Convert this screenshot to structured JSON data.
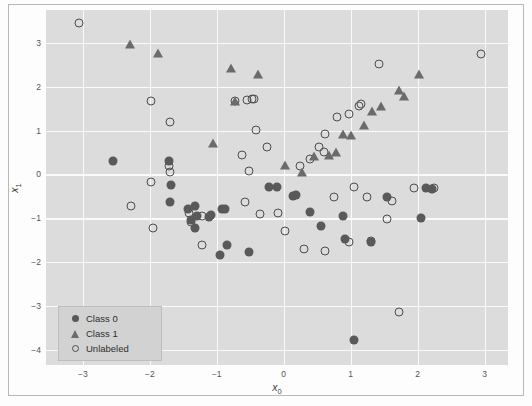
{
  "chart_data": {
    "type": "scatter",
    "title": "",
    "xlabel": "x_0",
    "ylabel": "x_1",
    "xlim": [
      -3.55,
      3.35
    ],
    "ylim": [
      -4.35,
      3.75
    ],
    "xticks": [
      -3,
      -2,
      -1,
      0,
      1,
      2,
      3
    ],
    "xtick_labels": [
      "−3",
      "−2",
      "−1",
      "0",
      "1",
      "2",
      "3"
    ],
    "yticks": [
      3,
      2,
      1,
      0,
      -1,
      -2,
      -3,
      -4
    ],
    "ytick_labels": [
      "3",
      "2",
      "1",
      "0",
      "−1",
      "−2",
      "−3",
      "−4"
    ],
    "grid": true,
    "legend_position": "lower left",
    "series": [
      {
        "name": "Class 0",
        "marker": "filled-circle",
        "color": "#595959",
        "points": [
          [
            -2.55,
            0.3
          ],
          [
            -1.72,
            0.31
          ],
          [
            -1.68,
            -0.25
          ],
          [
            -1.7,
            -0.62
          ],
          [
            -1.43,
            -0.8
          ],
          [
            -1.32,
            -0.72
          ],
          [
            -1.3,
            -0.95
          ],
          [
            -1.38,
            -1.05
          ],
          [
            -1.33,
            -1.22
          ],
          [
            -1.12,
            -0.98
          ],
          [
            -1.08,
            -0.92
          ],
          [
            -0.92,
            -0.78
          ],
          [
            -0.88,
            -0.8
          ],
          [
            -0.85,
            -1.62
          ],
          [
            -0.52,
            -1.78
          ],
          [
            -0.22,
            -0.28
          ],
          [
            -0.1,
            -0.28
          ],
          [
            0.14,
            -0.5
          ],
          [
            0.18,
            -0.46
          ],
          [
            0.4,
            -0.85
          ],
          [
            0.55,
            -1.18
          ],
          [
            0.88,
            -0.95
          ],
          [
            0.92,
            -1.48
          ],
          [
            1.05,
            -3.78
          ],
          [
            1.55,
            -0.52
          ],
          [
            2.05,
            -1.0
          ],
          [
            2.12,
            -0.3
          ],
          [
            2.22,
            -0.33
          ],
          [
            1.3,
            -1.55
          ],
          [
            -0.95,
            -1.85
          ]
        ]
      },
      {
        "name": "Class 1",
        "marker": "triangle",
        "color": "#6b6b6b",
        "points": [
          [
            -2.3,
            2.97
          ],
          [
            -1.88,
            2.78
          ],
          [
            -0.78,
            2.43
          ],
          [
            -0.38,
            2.28
          ],
          [
            -0.72,
            1.68
          ],
          [
            -1.05,
            0.72
          ],
          [
            0.02,
            0.22
          ],
          [
            0.28,
            0.05
          ],
          [
            0.45,
            0.42
          ],
          [
            0.68,
            0.45
          ],
          [
            0.78,
            0.52
          ],
          [
            0.88,
            0.93
          ],
          [
            1.0,
            0.9
          ],
          [
            1.2,
            1.12
          ],
          [
            1.32,
            1.45
          ],
          [
            1.45,
            1.55
          ],
          [
            1.72,
            1.92
          ],
          [
            1.8,
            1.78
          ],
          [
            2.02,
            2.3
          ]
        ]
      },
      {
        "name": "Unlabeled",
        "marker": "open-circle",
        "color": "#4d4d4d",
        "points": [
          [
            -3.05,
            3.45
          ],
          [
            -1.98,
            1.68
          ],
          [
            -1.7,
            1.2
          ],
          [
            -1.98,
            -0.18
          ],
          [
            -2.28,
            -0.72
          ],
          [
            -1.95,
            -1.22
          ],
          [
            -1.72,
            0.18
          ],
          [
            -1.7,
            0.05
          ],
          [
            -1.38,
            -1.08
          ],
          [
            -1.22,
            -1.62
          ],
          [
            -0.72,
            1.68
          ],
          [
            -0.55,
            1.7
          ],
          [
            -0.48,
            1.72
          ],
          [
            -0.62,
            0.45
          ],
          [
            -0.52,
            0.08
          ],
          [
            -0.42,
            1.02
          ],
          [
            -0.25,
            0.62
          ],
          [
            -0.58,
            -0.62
          ],
          [
            -0.35,
            -0.9
          ],
          [
            -0.08,
            -0.88
          ],
          [
            0.25,
            0.2
          ],
          [
            0.4,
            0.35
          ],
          [
            0.52,
            0.62
          ],
          [
            0.6,
            0.52
          ],
          [
            0.62,
            0.92
          ],
          [
            0.8,
            1.32
          ],
          [
            0.98,
            1.38
          ],
          [
            1.12,
            1.55
          ],
          [
            1.15,
            1.6
          ],
          [
            0.02,
            -1.3
          ],
          [
            0.3,
            -1.7
          ],
          [
            0.62,
            -1.75
          ],
          [
            0.75,
            -0.52
          ],
          [
            1.05,
            -0.28
          ],
          [
            1.25,
            -0.52
          ],
          [
            1.55,
            -1.02
          ],
          [
            1.62,
            -0.6
          ],
          [
            1.72,
            -3.15
          ],
          [
            1.95,
            -0.3
          ],
          [
            2.25,
            -0.32
          ],
          [
            2.95,
            2.75
          ],
          [
            1.42,
            2.52
          ],
          [
            -0.45,
            1.73
          ],
          [
            -1.22,
            -0.95
          ],
          [
            1.3,
            -1.52
          ],
          [
            0.98,
            -1.55
          ],
          [
            -1.42,
            -0.88
          ]
        ]
      }
    ]
  },
  "legend": {
    "items": [
      {
        "label": "Class 0",
        "marker": "filled-circle"
      },
      {
        "label": "Class 1",
        "marker": "triangle"
      },
      {
        "label": "Unlabeled",
        "marker": "open-circle"
      }
    ]
  },
  "axes": {
    "xlabel_base": "x",
    "xlabel_sub": "0",
    "ylabel_base": "x",
    "ylabel_sub": "1"
  },
  "colors": {
    "plot_background": "#dcdcdc",
    "gridline": "#fafafa",
    "class0": "#595959",
    "class1": "#6b6b6b",
    "unlabeled": "#4d4d4d",
    "legend_background": "#d2d2d2",
    "tick_text": "#545454"
  }
}
